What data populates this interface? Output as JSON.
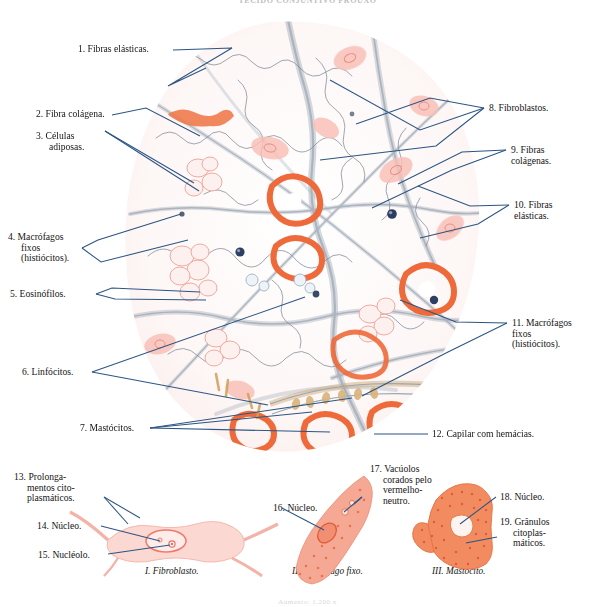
{
  "plate": {
    "title": "TECIDO CONJUNTIVO FROUXO",
    "footer": "Aumento: 1.200 x",
    "accent_color": "#2b5583",
    "cell_pink": "#f6b3ac",
    "cell_orange": "#ef6a3a",
    "fiber_gray": "#8f9aa8",
    "background": "#ffffff"
  },
  "main_figure": {
    "name": "loose-connective-tissue-micrograph",
    "labels": [
      {
        "id": "1",
        "text": "1.  Fibras elásticas.",
        "side": "left"
      },
      {
        "id": "2",
        "text": "2.  Fibra colágena.",
        "side": "left"
      },
      {
        "id": "3",
        "text": "3.  Células\nadiposas.",
        "side": "left"
      },
      {
        "id": "4",
        "text": "4.  Macrófagos\nfixos\n(histiócitos).",
        "side": "left"
      },
      {
        "id": "5",
        "text": "5.  Eosinófilos.",
        "side": "left"
      },
      {
        "id": "6",
        "text": "6.  Linfócitos.",
        "side": "left"
      },
      {
        "id": "7",
        "text": "7.  Mastócitos.",
        "side": "left"
      },
      {
        "id": "8",
        "text": "8.  Fibroblastos.",
        "side": "right"
      },
      {
        "id": "9",
        "text": "9.  Fibras\n     colágenas.",
        "side": "right"
      },
      {
        "id": "10",
        "text": "10.  Fibras\n       elásticas.",
        "side": "right"
      },
      {
        "id": "11",
        "text": "11.  Macrófagos\n       fixos\n       (histiócitos).",
        "side": "right"
      },
      {
        "id": "12",
        "text": "12.  Capilar com hemácias.",
        "side": "right"
      }
    ]
  },
  "detail_figures": [
    {
      "roman": "I",
      "caption": "I. Fibroblasto.",
      "labels": [
        {
          "id": "13",
          "text": "13.  Prolonga-\nmentos cito-\nplasmáticos."
        },
        {
          "id": "14",
          "text": "14.  Núcleo."
        },
        {
          "id": "15",
          "text": "15.  Nucléolo."
        }
      ]
    },
    {
      "roman": "II",
      "caption": "II. Macrófago fixo.",
      "labels": [
        {
          "id": "16",
          "text": "16.  Núcleo."
        },
        {
          "id": "17",
          "text": "17.  Vacúolos\ncorados pelo\nvermelho-\nneutro."
        }
      ]
    },
    {
      "roman": "III",
      "caption": "III. Mastócito.",
      "labels": [
        {
          "id": "18",
          "text": "18.  Núcleo."
        },
        {
          "id": "19",
          "text": "19.  Grânulos\ncitoplas-\nmáticos."
        }
      ]
    }
  ]
}
